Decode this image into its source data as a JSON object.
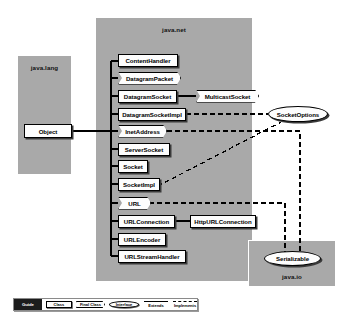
{
  "diagram": {
    "colors": {
      "package_fill": "#a9a9a9",
      "node_fill": "#fdfdfd",
      "stroke": "#000000",
      "shadow": "#3a3a3a",
      "legend_guide_fill": "#1c1c1c",
      "canvas": "#ffffff"
    }
  },
  "packages": [
    {
      "id": "java_lang",
      "label": "java.lang",
      "label_pos": "top"
    },
    {
      "id": "java_net",
      "label": "java.net",
      "label_pos": "top"
    },
    {
      "id": "java_io",
      "label": "java.io",
      "label_pos": "bottom"
    }
  ],
  "nodes": {
    "object": {
      "label": "Object",
      "kind": "class"
    },
    "content_handler": {
      "label": "ContentHandler",
      "kind": "class"
    },
    "datagram_packet": {
      "label": "DatagramPacket",
      "kind": "final-class"
    },
    "datagram_socket": {
      "label": "DatagramSocket",
      "kind": "class"
    },
    "datagram_socket_impl": {
      "label": "DatagramSocketImpl",
      "kind": "class"
    },
    "inet_address": {
      "label": "InetAddress",
      "kind": "final-class"
    },
    "server_socket": {
      "label": "ServerSocket",
      "kind": "class"
    },
    "socket": {
      "label": "Socket",
      "kind": "class"
    },
    "socket_impl": {
      "label": "SocketImpl",
      "kind": "class"
    },
    "url": {
      "label": "URL",
      "kind": "final-class"
    },
    "url_connection": {
      "label": "URLConnection",
      "kind": "class"
    },
    "url_encoder": {
      "label": "URLEncoder",
      "kind": "class"
    },
    "url_stream_handler": {
      "label": "URLStreamHandler",
      "kind": "class"
    },
    "multicast_socket": {
      "label": "MulticastSocket",
      "kind": "final-class"
    },
    "http_url_connection": {
      "label": "HttpURLConnection",
      "kind": "class"
    },
    "socket_options": {
      "label": "SocketOptions",
      "kind": "interface"
    },
    "serializable": {
      "label": "Serializable",
      "kind": "interface"
    }
  },
  "relationships": [
    {
      "from": "object",
      "to": "content_handler",
      "type": "extends"
    },
    {
      "from": "object",
      "to": "datagram_packet",
      "type": "extends"
    },
    {
      "from": "object",
      "to": "datagram_socket",
      "type": "extends"
    },
    {
      "from": "object",
      "to": "datagram_socket_impl",
      "type": "extends"
    },
    {
      "from": "object",
      "to": "inet_address",
      "type": "extends"
    },
    {
      "from": "object",
      "to": "server_socket",
      "type": "extends"
    },
    {
      "from": "object",
      "to": "socket",
      "type": "extends"
    },
    {
      "from": "object",
      "to": "socket_impl",
      "type": "extends"
    },
    {
      "from": "object",
      "to": "url",
      "type": "extends"
    },
    {
      "from": "object",
      "to": "url_connection",
      "type": "extends"
    },
    {
      "from": "object",
      "to": "url_encoder",
      "type": "extends"
    },
    {
      "from": "object",
      "to": "url_stream_handler",
      "type": "extends"
    },
    {
      "from": "datagram_socket",
      "to": "multicast_socket",
      "type": "extends"
    },
    {
      "from": "url_connection",
      "to": "http_url_connection",
      "type": "extends"
    },
    {
      "from": "datagram_socket_impl",
      "to": "socket_options",
      "type": "implements"
    },
    {
      "from": "socket_impl",
      "to": "socket_options",
      "type": "implements"
    },
    {
      "from": "inet_address",
      "to": "serializable",
      "type": "implements"
    },
    {
      "from": "url",
      "to": "serializable",
      "type": "implements"
    }
  ],
  "legend": {
    "guide_label": "Guide",
    "class_label": "Class",
    "final_class_label": "Final Class",
    "interface_label": "Interface",
    "extends_label": "Extends",
    "implements_label": "Implements"
  }
}
